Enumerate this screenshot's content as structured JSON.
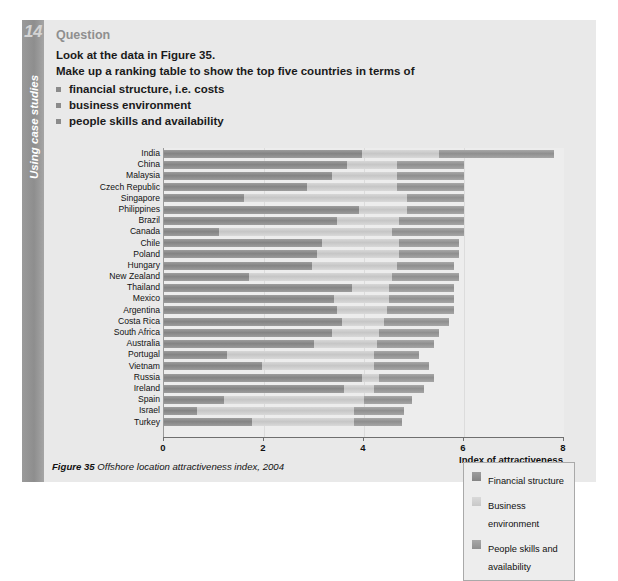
{
  "sidebar": {
    "chapter_number": "14",
    "label": "Using case studies"
  },
  "question": {
    "heading": "Question",
    "line1": "Look at the data in Figure 35.",
    "line2": "Make up a ranking table to show the top five countries in terms of",
    "bullets": [
      "financial structure, i.e. costs",
      "business environment",
      "people skills and availability"
    ]
  },
  "caption": {
    "figure_label": "Figure 35",
    "text": "Offshore location attractiveness index, 2004"
  },
  "legend": {
    "items": [
      "Financial structure",
      "Business environment",
      "People skills and availability"
    ]
  },
  "axis": {
    "title": "Index of attractiveness",
    "ticks": [
      "0",
      "2",
      "4",
      "6",
      "8"
    ]
  },
  "chart_data": {
    "type": "bar",
    "orientation": "horizontal",
    "stacked": true,
    "title": "Offshore location attractiveness index, 2004",
    "xlabel": "Index of attractiveness",
    "ylabel": "",
    "xlim": [
      0,
      8
    ],
    "xticks": [
      0,
      2,
      4,
      6,
      8
    ],
    "grid": true,
    "legend_position": "bottom-right",
    "categories": [
      "India",
      "China",
      "Malaysia",
      "Czech Republic",
      "Singapore",
      "Philippines",
      "Brazil",
      "Canada",
      "Chile",
      "Poland",
      "Hungary",
      "New Zealand",
      "Thailand",
      "Mexico",
      "Argentina",
      "Costa Rica",
      "South Africa",
      "Australia",
      "Portugal",
      "Vietnam",
      "Russia",
      "Ireland",
      "Spain",
      "Israel",
      "Turkey"
    ],
    "series": [
      {
        "name": "Financial structure",
        "color": "#8c8c8c",
        "values": [
          3.95,
          3.65,
          3.35,
          2.85,
          1.6,
          3.9,
          3.45,
          1.1,
          3.15,
          3.05,
          2.95,
          1.7,
          3.75,
          3.4,
          3.45,
          3.55,
          3.35,
          3.0,
          1.25,
          1.95,
          3.95,
          3.6,
          1.2,
          0.65,
          1.75
        ]
      },
      {
        "name": "Business environment",
        "color": "#cccccc",
        "values": [
          1.55,
          1.0,
          1.3,
          1.8,
          3.25,
          0.95,
          1.25,
          3.45,
          1.55,
          1.65,
          1.7,
          2.85,
          0.75,
          1.1,
          1.0,
          0.85,
          0.95,
          1.25,
          2.95,
          2.25,
          0.35,
          0.6,
          2.8,
          3.15,
          2.05
        ]
      },
      {
        "name": "People skills and availability",
        "color": "#999999",
        "values": [
          2.3,
          1.35,
          1.35,
          1.35,
          1.15,
          1.15,
          1.3,
          1.45,
          1.2,
          1.2,
          1.15,
          1.35,
          1.3,
          1.3,
          1.35,
          1.3,
          1.2,
          1.15,
          0.9,
          1.1,
          1.1,
          1.0,
          0.95,
          1.0,
          0.95
        ]
      }
    ],
    "totals": [
      7.8,
      6.0,
      6.0,
      6.0,
      6.0,
      6.0,
      6.0,
      6.0,
      5.9,
      5.9,
      5.8,
      5.9,
      5.8,
      5.8,
      5.8,
      5.7,
      5.5,
      5.4,
      5.1,
      5.3,
      5.4,
      5.2,
      4.95,
      4.8,
      4.75
    ]
  }
}
